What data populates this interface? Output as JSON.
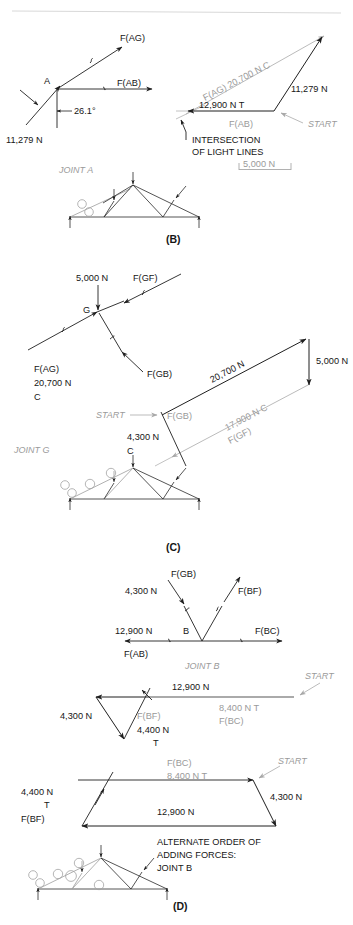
{
  "figure": {
    "panels": [
      "(B)",
      "(C)",
      "(D)"
    ]
  },
  "colors": {
    "ink": "#1a1a1a",
    "light_line": "#b3b3b3",
    "gray_text": "#9a9a9a",
    "truss": "#2a2a2a"
  },
  "panel_b": {
    "id": "(B)",
    "joint_label": "JOINT A",
    "fbd": {
      "node": "A",
      "forces": [
        {
          "name": "F(AG)",
          "label": "F(AG)"
        },
        {
          "name": "F(AB)",
          "label": "F(AB)"
        },
        {
          "name": "reaction",
          "label": "11,279 N"
        }
      ],
      "angle": "26.1°"
    },
    "polygon": {
      "start_label": "START",
      "members": [
        {
          "label": "F(AG) 20,700 N C"
        },
        {
          "label": "12,900 N T"
        },
        {
          "label": "F(AB)"
        },
        {
          "label": "11,279 N"
        }
      ],
      "callout": [
        "INTERSECTION",
        "OF LIGHT LINES"
      ],
      "scale_bar": "5,000 N"
    }
  },
  "panel_c": {
    "id": "(C)",
    "joint_label": "JOINT G",
    "fbd": {
      "node": "G",
      "forces": [
        {
          "label": "5,000 N"
        },
        {
          "label": "F(GF)"
        },
        {
          "label": "F(GB)"
        },
        {
          "label": "F(AG)"
        },
        {
          "label": "20,700 N"
        },
        {
          "label": "C"
        }
      ]
    },
    "polygon": {
      "start_label": "START",
      "members": [
        {
          "label": "20,700 N"
        },
        {
          "label": "5,000 N"
        },
        {
          "label": "17,900 N C"
        },
        {
          "label": "F(GF)"
        },
        {
          "label": "F(GB)"
        },
        {
          "label": "4,300 N"
        },
        {
          "label": "C"
        }
      ]
    }
  },
  "panel_d": {
    "id": "(D)",
    "joint_label": "JOINT B",
    "fbd": {
      "node": "B",
      "forces": [
        {
          "label": "4,300 N"
        },
        {
          "label": "F(GB)"
        },
        {
          "label": "F(BF)"
        },
        {
          "label": "12,900 N"
        },
        {
          "label": "F(AB)"
        },
        {
          "label": "F(BC)"
        }
      ]
    },
    "polygon1": {
      "start_label": "START",
      "members": [
        {
          "label": "12,900 N"
        },
        {
          "label": "8,400 N T"
        },
        {
          "label": "F(BC)"
        },
        {
          "label": "4,300 N"
        },
        {
          "label": "F(BF)"
        },
        {
          "label": "4,400 N"
        },
        {
          "label": "T"
        }
      ]
    },
    "polygon2": {
      "start_label": "START",
      "members": [
        {
          "label": "F(BC)"
        },
        {
          "label": "8,400 N T"
        },
        {
          "label": "4,300 N"
        },
        {
          "label": "12,900 N"
        },
        {
          "label": "4,400 N"
        },
        {
          "label": "T"
        },
        {
          "label": "F(BF)"
        }
      ],
      "caption": [
        "ALTERNATE ORDER OF",
        "ADDING FORCES:",
        "JOINT B"
      ]
    }
  }
}
